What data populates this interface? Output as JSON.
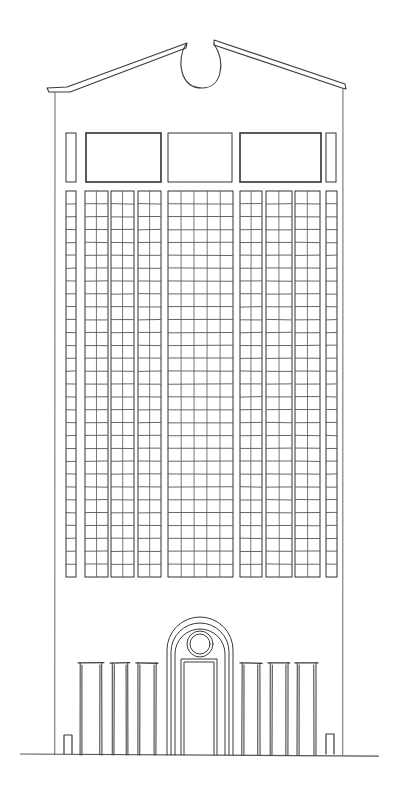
{
  "drawing": {
    "title": "Hand-drawn facade elevation sketch",
    "subject": "tower-facade",
    "ink_color": "#333333",
    "paper_color": "#ffffff",
    "elements": {
      "pediment": "broken pediment with oculus",
      "upper_band": "clerestory window band",
      "grid_bays": 10,
      "grid_rows": 30,
      "ground_portals": 6,
      "central_arch": "arched entrance with round window",
      "bollards": 2
    }
  }
}
